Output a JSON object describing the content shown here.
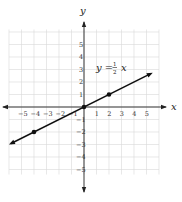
{
  "chart_data": {
    "type": "line",
    "title": "",
    "xlabel": "x",
    "ylabel": "y",
    "xlim": [
      -6,
      6
    ],
    "ylim": [
      -6,
      6
    ],
    "grid": true,
    "x_ticks": [
      -5,
      -4,
      -3,
      -2,
      -1,
      1,
      2,
      3,
      4,
      5
    ],
    "y_ticks": [
      5,
      4,
      3,
      2,
      1,
      -1,
      -2,
      -3,
      -4,
      -5
    ],
    "series": [
      {
        "name": "y = 1/2 x",
        "equation": "y = ½ x",
        "slope": 0.5,
        "intercept": 0,
        "points": [
          {
            "x": -4,
            "y": -2
          },
          {
            "x": 0,
            "y": 0
          },
          {
            "x": 2,
            "y": 1
          }
        ],
        "line_extent": {
          "x_start": -6,
          "x_end": 5.5
        }
      }
    ],
    "annotations": [
      {
        "text": "y = ½ x",
        "x": 1.0,
        "y": 2.9
      }
    ],
    "legend": "none"
  },
  "labels": {
    "x_axis": "x",
    "y_axis": "y",
    "equation_lhs": "y =",
    "equation_num": "1",
    "equation_den": "2",
    "equation_var": "x"
  },
  "colors": {
    "grid": "#d9d9d9",
    "axis": "#222222",
    "line": "#111111",
    "point": "#111111"
  }
}
